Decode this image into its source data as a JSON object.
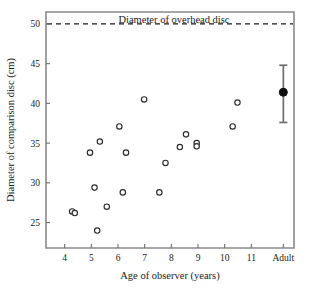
{
  "chart_data": {
    "type": "scatter",
    "title": "",
    "annotation_label": "Diameter of overhead disc",
    "xlabel": "Age of observer (years)",
    "ylabel": "Diameter of comparison disc (cm)",
    "xlim": [
      3.3,
      12.6
    ],
    "ylim": [
      21.8,
      51.5
    ],
    "grid": false,
    "legend": "none",
    "x_tick_labels": [
      "4",
      "5",
      "6",
      "7",
      "8",
      "9",
      "10",
      "11",
      "Adult"
    ],
    "x_tick_values": [
      4,
      5,
      6,
      7,
      8,
      9,
      10,
      11,
      12.2
    ],
    "y_tick_labels": [
      "25",
      "30",
      "35",
      "40",
      "45",
      "50"
    ],
    "y_tick_values": [
      25,
      30,
      35,
      40,
      45,
      50
    ],
    "reference_line": {
      "y": 50,
      "style": "dashed",
      "label": "Diameter of overhead disc"
    },
    "series": [
      {
        "name": "Children (individual observers)",
        "marker": "open-circle",
        "points": [
          {
            "x": 4.28,
            "y": 26.4
          },
          {
            "x": 4.38,
            "y": 26.2
          },
          {
            "x": 4.95,
            "y": 33.8
          },
          {
            "x": 5.12,
            "y": 29.4
          },
          {
            "x": 5.22,
            "y": 24.0
          },
          {
            "x": 5.32,
            "y": 35.2
          },
          {
            "x": 5.58,
            "y": 27.0
          },
          {
            "x": 6.05,
            "y": 37.1
          },
          {
            "x": 6.18,
            "y": 28.8
          },
          {
            "x": 6.3,
            "y": 33.8
          },
          {
            "x": 6.98,
            "y": 40.5
          },
          {
            "x": 7.55,
            "y": 28.8
          },
          {
            "x": 7.78,
            "y": 32.5
          },
          {
            "x": 8.32,
            "y": 34.5
          },
          {
            "x": 8.55,
            "y": 36.1
          },
          {
            "x": 8.95,
            "y": 35.0
          },
          {
            "x": 8.95,
            "y": 34.6
          },
          {
            "x": 10.3,
            "y": 37.1
          },
          {
            "x": 10.48,
            "y": 40.1
          }
        ]
      },
      {
        "name": "Adult mean",
        "marker": "filled-circle",
        "points": [
          {
            "x": 12.2,
            "y": 41.4,
            "err_low": 37.6,
            "err_high": 44.8
          }
        ]
      }
    ]
  },
  "axes": {
    "x_title": "Age of observer (years)",
    "y_title": "Diameter of comparison disc (cm)"
  },
  "annotations": {
    "overhead_disc": "Diameter of overhead disc"
  },
  "colors": {
    "frame": "#8a8a8a",
    "marker_stroke": "#2b2b2b",
    "marker_fill": "#ffffff",
    "adult_marker": "#0d0d0d",
    "error_bar": "#6e6e6e",
    "reference_line": "#1a1a1a",
    "text": "#1a1a1a",
    "background": "#ffffff"
  }
}
